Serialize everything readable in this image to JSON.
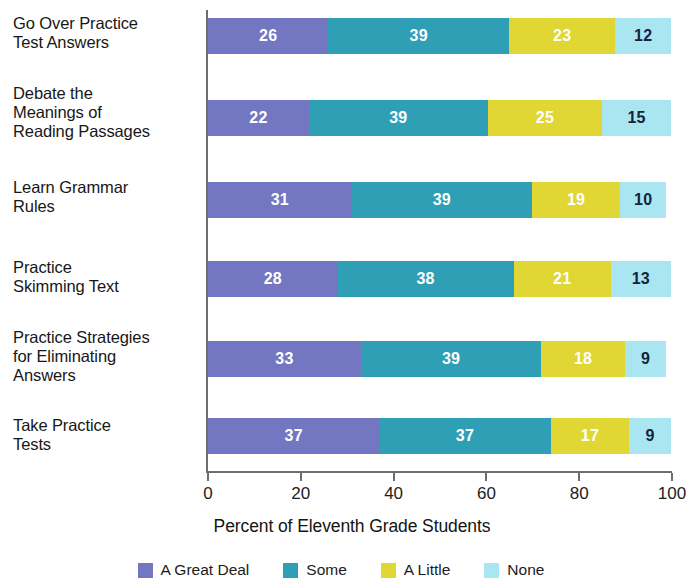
{
  "chart_data": {
    "type": "bar",
    "subtype": "horizontal-stacked-100",
    "title": "",
    "xlabel": "Percent of Eleventh Grade Students",
    "ylabel": "",
    "xlim": [
      0,
      100
    ],
    "xticks": [
      0,
      20,
      40,
      60,
      80,
      100
    ],
    "xticklabels": [
      "0",
      "20",
      "40",
      "60",
      "80",
      "100"
    ],
    "grid": false,
    "legend_position": "bottom",
    "categories": [
      "Go Over Practice\nTest Answers",
      "Debate the\nMeanings of\nReading Passages",
      "Learn Grammar\nRules",
      "Practice\nSkimming Text",
      "Practice Strategies\nfor Eliminating\nAnswers",
      "Take Practice\nTests"
    ],
    "series": [
      {
        "name": "A Great Deal",
        "color": "#7376c0",
        "label_color": "#ffffff",
        "values": [
          26,
          22,
          31,
          28,
          33,
          37
        ]
      },
      {
        "name": "Some",
        "color": "#2f9fb5",
        "label_color": "#ffffff",
        "values": [
          39,
          39,
          39,
          38,
          39,
          37
        ]
      },
      {
        "name": "A Little",
        "color": "#e0d634",
        "label_color": "#ffffff",
        "values": [
          23,
          25,
          19,
          21,
          18,
          17
        ]
      },
      {
        "name": "None",
        "color": "#a9e6f2",
        "label_color": "#16233a",
        "values": [
          12,
          15,
          10,
          13,
          9,
          9
        ]
      }
    ]
  },
  "axis": {
    "line_color": "#6e6e6e"
  },
  "layout": {
    "bar_tops": [
      18,
      100,
      182,
      261,
      341,
      418
    ],
    "label_tops": [
      14,
      84,
      178,
      258,
      328,
      416
    ]
  }
}
